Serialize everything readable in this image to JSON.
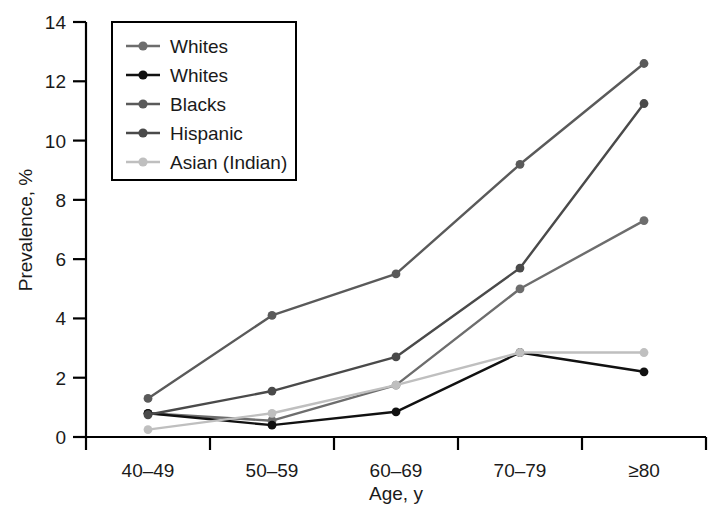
{
  "chart_data": {
    "type": "line",
    "title": "",
    "xlabel": "Age, y",
    "ylabel": "Prevalence, %",
    "categories": [
      "40–49",
      "50–59",
      "60–69",
      "70–79",
      "≥80"
    ],
    "ylim": [
      0,
      14
    ],
    "yticks": [
      0,
      2,
      4,
      6,
      8,
      10,
      12,
      14
    ],
    "ytick_labels": [
      "0",
      "2",
      "4",
      "6",
      "8",
      "10",
      "12",
      "14"
    ],
    "grid": false,
    "legend_position": "upper-left-inset",
    "series": [
      {
        "name": "Whites",
        "color": "#6d6d6d",
        "values": [
          0.8,
          0.55,
          1.75,
          5.0,
          7.3
        ]
      },
      {
        "name": "Whites",
        "color": "#111111",
        "values": [
          0.8,
          0.4,
          0.85,
          2.85,
          2.2
        ]
      },
      {
        "name": "Blacks",
        "color": "#5a5a5a",
        "values": [
          1.3,
          4.1,
          5.5,
          9.2,
          12.6
        ]
      },
      {
        "name": "Hispanic",
        "color": "#4a4a4a",
        "values": [
          0.75,
          1.55,
          2.7,
          5.7,
          11.25
        ]
      },
      {
        "name": "Asian (Indian)",
        "color": "#bfbfbf",
        "values": [
          0.25,
          0.8,
          1.75,
          2.85,
          2.85
        ]
      }
    ]
  },
  "legend": {
    "entries": [
      {
        "label": "Whites"
      },
      {
        "label": "Whites"
      },
      {
        "label": "Blacks"
      },
      {
        "label": "Hispanic"
      },
      {
        "label": "Asian (Indian)"
      }
    ]
  },
  "axes": {
    "y_title": "Prevalence, %",
    "x_title": "Age, y"
  }
}
